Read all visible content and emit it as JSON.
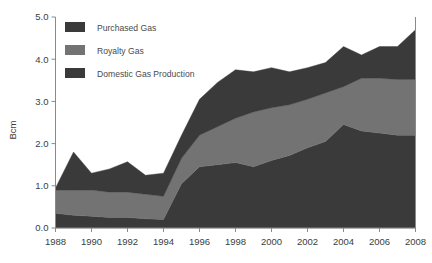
{
  "chart_data": {
    "type": "area",
    "title": "",
    "subtitle": "",
    "xlabel": "",
    "ylabel": "Bcm",
    "stacked": true,
    "grid": false,
    "legend_position": "top-left-inside",
    "xlim": [
      1988,
      2008
    ],
    "ylim": [
      0.0,
      5.0
    ],
    "ytick_labels": [
      "0.0",
      "1.0",
      "2.0",
      "3.0",
      "4.0",
      "5.0"
    ],
    "ytick_values": [
      0.0,
      1.0,
      2.0,
      3.0,
      4.0,
      5.0
    ],
    "xtick_labels": [
      "1988",
      "1990",
      "1992",
      "1994",
      "1996",
      "1998",
      "2000",
      "2002",
      "2004",
      "2006",
      "2008"
    ],
    "xtick_values": [
      1988,
      1990,
      1992,
      1994,
      1996,
      1998,
      2000,
      2002,
      2004,
      2006,
      2008
    ],
    "x": [
      1988,
      1989,
      1990,
      1991,
      1992,
      1993,
      1994,
      1995,
      1996,
      1997,
      1998,
      1999,
      2000,
      2001,
      2002,
      2003,
      2004,
      2005,
      2006,
      2007,
      2008
    ],
    "series": [
      {
        "name": "Domestic Gas Production",
        "color": "#3a3a3a",
        "stack_order": 1,
        "values": [
          0.35,
          0.3,
          0.28,
          0.25,
          0.25,
          0.22,
          0.2,
          1.05,
          1.45,
          1.5,
          1.55,
          1.45,
          1.6,
          1.72,
          1.9,
          2.05,
          2.45,
          2.3,
          2.25,
          2.2,
          2.2
        ]
      },
      {
        "name": "Royalty Gas",
        "color": "#737373",
        "stack_order": 2,
        "values": [
          0.55,
          0.6,
          0.62,
          0.6,
          0.6,
          0.58,
          0.55,
          0.6,
          0.75,
          0.9,
          1.05,
          1.3,
          1.25,
          1.2,
          1.15,
          1.15,
          0.9,
          1.25,
          1.3,
          1.32,
          1.32
        ]
      },
      {
        "name": "Purchased Gas",
        "color": "#3a3a3a",
        "stack_order": 3,
        "values": [
          0.05,
          0.9,
          0.4,
          0.55,
          0.72,
          0.45,
          0.55,
          0.55,
          0.85,
          1.05,
          1.15,
          0.95,
          0.95,
          0.78,
          0.75,
          0.72,
          0.95,
          0.55,
          0.75,
          0.78,
          1.18
        ]
      }
    ],
    "totals": [
      0.95,
      1.8,
      1.3,
      1.4,
      1.57,
      1.25,
      1.3,
      2.2,
      3.05,
      3.45,
      3.75,
      3.7,
      3.8,
      3.7,
      3.8,
      3.92,
      4.3,
      4.1,
      4.3,
      4.3,
      4.7
    ]
  },
  "legend": {
    "entries": [
      {
        "label": "Purchased Gas",
        "color": "#3a3a3a"
      },
      {
        "label": "Royalty Gas",
        "color": "#737373"
      },
      {
        "label": "Domestic Gas Production",
        "color": "#3a3a3a"
      }
    ]
  },
  "colors": {
    "axis": "#8a8a8a",
    "text": "#3d3d3d",
    "background": "#ffffff",
    "band_dark": "#3a3a3a",
    "band_mid": "#737373"
  }
}
